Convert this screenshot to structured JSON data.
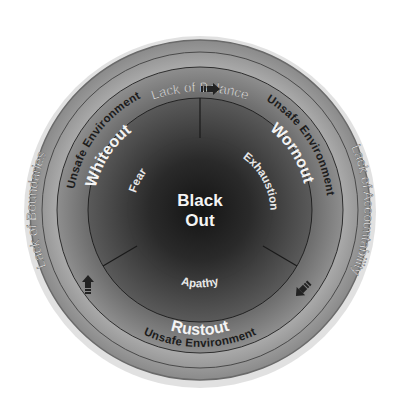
{
  "diagram": {
    "center": {
      "line1": "Black",
      "line2": "Out"
    },
    "outer_ring": {
      "top": "Lack of Balance",
      "left": "Lack of Boundaries",
      "right": "Lack of Accountability"
    },
    "environment_ring": {
      "top_left": "Unsafe Environment",
      "top_right": "Unsafe Environment",
      "bottom": "Unsafe Environment"
    },
    "states": [
      {
        "name": "Whiteout",
        "cause": "Fear"
      },
      {
        "name": "Wornout",
        "cause": "Exhaustion"
      },
      {
        "name": "Rustout",
        "cause": "Apathy"
      }
    ],
    "arrows": [
      {
        "position": "top",
        "direction": "clockwise",
        "icon": "arrow-right-icon"
      },
      {
        "position": "lower-right",
        "direction": "clockwise",
        "icon": "arrow-down-left-icon"
      },
      {
        "position": "lower-left",
        "direction": "clockwise",
        "icon": "arrow-up-icon"
      }
    ],
    "colors": {
      "outer_ring": "#9a9a9a",
      "environment_ring": "#858585",
      "core_dark": "#1e1e1e",
      "core_mid": "#4a4a4a",
      "light_text": "#f2f2f2",
      "dark_text": "#1c1c1c"
    }
  }
}
